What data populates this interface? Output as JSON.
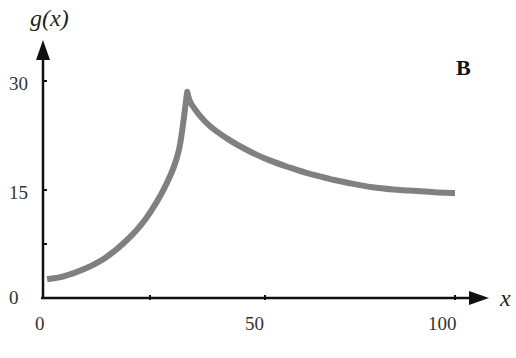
{
  "chart_data": {
    "type": "line",
    "title": "",
    "panel_label": "B",
    "xlabel": "x",
    "ylabel": "g(x)",
    "xlim": [
      0,
      100
    ],
    "ylim": [
      0,
      30
    ],
    "x_ticks": [
      0,
      50,
      100
    ],
    "x_tick_labels": [
      "0",
      "50",
      "100"
    ],
    "y_ticks": [
      0,
      15,
      30
    ],
    "y_tick_labels": [
      "0",
      "15",
      "30"
    ],
    "minor_ticks_y": [
      7.5
    ],
    "grid": false,
    "legend": null,
    "series": [
      {
        "name": "g(x)",
        "color": "#808080",
        "x": [
          1,
          5,
          10,
          15,
          20,
          25,
          30,
          33,
          35,
          36,
          40,
          45,
          50,
          55,
          60,
          65,
          70,
          75,
          80,
          85,
          90,
          95,
          100
        ],
        "values": [
          2.6,
          3.0,
          4.0,
          5.5,
          7.8,
          11.0,
          15.8,
          20.5,
          28.5,
          26.8,
          24.0,
          21.9,
          20.3,
          19.0,
          18.0,
          17.1,
          16.4,
          15.8,
          15.3,
          15.0,
          14.8,
          14.6,
          14.5
        ]
      }
    ]
  },
  "labels": {
    "ylabel": "g(x)",
    "xlabel": "x",
    "panel": "B",
    "y30": "30",
    "y15": "15",
    "y0": "0",
    "x0": "0",
    "x50": "50",
    "x100": "100"
  }
}
